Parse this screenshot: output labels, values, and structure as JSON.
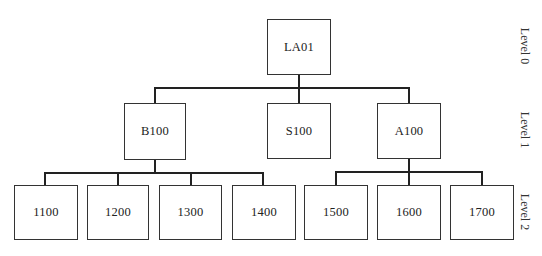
{
  "diagram": {
    "type": "hierarchy-tree",
    "levels": [
      {
        "label": "Level 0"
      },
      {
        "label": "Level 1"
      },
      {
        "label": "Level 2"
      }
    ],
    "root": {
      "label": "LA01"
    },
    "level1": [
      {
        "label": "B100"
      },
      {
        "label": "S100"
      },
      {
        "label": "A100"
      }
    ],
    "level2": [
      {
        "label": "1100",
        "parent": "B100"
      },
      {
        "label": "1200",
        "parent": "B100"
      },
      {
        "label": "1300",
        "parent": "B100"
      },
      {
        "label": "1400",
        "parent": "B100"
      },
      {
        "label": "1500",
        "parent": "A100"
      },
      {
        "label": "1600",
        "parent": "A100"
      },
      {
        "label": "1700",
        "parent": "A100"
      }
    ],
    "colors": {
      "line": "#222222",
      "box_border": "#333333",
      "background": "#ffffff"
    }
  }
}
